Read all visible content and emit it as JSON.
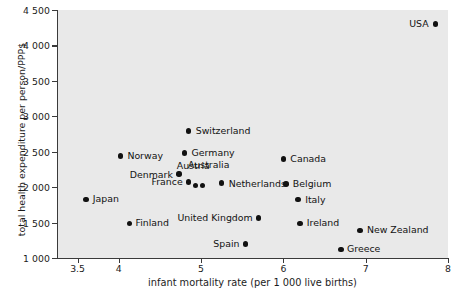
{
  "chart_data": {
    "type": "scatter",
    "title": "",
    "xlabel": "infant mortality rate (per 1 000 live births)",
    "ylabel": "total health expenditure per person/PPP$",
    "xlim": [
      3.25,
      8
    ],
    "ylim": [
      1000,
      4500
    ],
    "grid": false,
    "legend": "none",
    "xticks": [
      "3.5",
      "4",
      "5",
      "6",
      "7",
      "8"
    ],
    "xtick_values": [
      3.5,
      4,
      5,
      6,
      7,
      8
    ],
    "yticks": [
      "1 000",
      "1 500",
      "2 000",
      "2 500",
      "3 000",
      "3 500",
      "4 000",
      "4 500"
    ],
    "ytick_values": [
      1000,
      1500,
      2000,
      2500,
      3000,
      3500,
      4000,
      4500
    ],
    "points": [
      {
        "label": "USA",
        "x": 7.85,
        "y": 4300,
        "side": "left",
        "dx": -7,
        "dy": 0
      },
      {
        "label": "Switzerland",
        "x": 4.85,
        "y": 2790,
        "side": "right",
        "dx": 7,
        "dy": 0
      },
      {
        "label": "Germany",
        "x": 4.8,
        "y": 2480,
        "side": "right",
        "dx": 7,
        "dy": 0
      },
      {
        "label": "Norway",
        "x": 4.02,
        "y": 2440,
        "side": "right",
        "dx": 7,
        "dy": 0
      },
      {
        "label": "Canada",
        "x": 6.0,
        "y": 2400,
        "side": "right",
        "dx": 7,
        "dy": 0
      },
      {
        "label": "Denmark",
        "x": 4.73,
        "y": 2185,
        "side": "left",
        "dx": -6,
        "dy": -1
      },
      {
        "label": "Netherlands",
        "x": 5.25,
        "y": 2060,
        "side": "right",
        "dx": 7,
        "dy": -1
      },
      {
        "label": "Belgium",
        "x": 6.03,
        "y": 2045,
        "side": "right",
        "dx": 7,
        "dy": 0
      },
      {
        "label": "France",
        "x": 4.85,
        "y": 2070,
        "side": "left",
        "dx": -6,
        "dy": 0
      },
      {
        "label": "Austria",
        "x": 4.93,
        "y": 2020,
        "side": "above",
        "dx": -2,
        "dy": 16
      },
      {
        "label": "Australia",
        "x": 5.02,
        "y": 2025,
        "side": "above",
        "dx": 6,
        "dy": 16
      },
      {
        "label": "Italy",
        "x": 6.18,
        "y": 1825,
        "side": "right",
        "dx": 7,
        "dy": 0
      },
      {
        "label": "Japan",
        "x": 3.6,
        "y": 1830,
        "side": "right",
        "dx": 7,
        "dy": 0
      },
      {
        "label": "United Kingdom",
        "x": 5.7,
        "y": 1565,
        "side": "left",
        "dx": -6,
        "dy": 0
      },
      {
        "label": "Ireland",
        "x": 6.2,
        "y": 1490,
        "side": "right",
        "dx": 7,
        "dy": 0
      },
      {
        "label": "Finland",
        "x": 4.13,
        "y": 1490,
        "side": "right",
        "dx": 6,
        "dy": 0
      },
      {
        "label": "New Zealand",
        "x": 6.93,
        "y": 1390,
        "side": "right",
        "dx": 7,
        "dy": 0
      },
      {
        "label": "Spain",
        "x": 5.54,
        "y": 1195,
        "side": "left",
        "dx": -6,
        "dy": 0
      },
      {
        "label": "Greece",
        "x": 6.7,
        "y": 1120,
        "side": "right",
        "dx": 6,
        "dy": 0
      }
    ]
  },
  "colors": {
    "plot_background": "#e9e9e9",
    "page_background": "#ffffff",
    "axis": "#3a3a3a",
    "marker": "#111111",
    "text": "#1c1c1c"
  }
}
